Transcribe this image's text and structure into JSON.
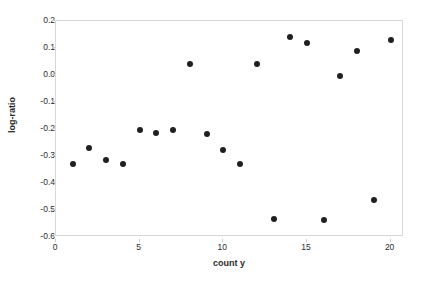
{
  "chart_data": {
    "type": "scatter",
    "title": "",
    "xlabel": "count y",
    "ylabel": "log-ratio",
    "xlim": [
      0,
      20.8
    ],
    "ylim": [
      -0.6,
      0.2
    ],
    "xticks": [
      0,
      5,
      10,
      15,
      20
    ],
    "xtick_labels": [
      "0",
      "5",
      "10",
      "15",
      "20"
    ],
    "yticks": [
      0.2,
      0.1,
      0.0,
      -0.1,
      -0.2,
      -0.3,
      -0.4,
      -0.5,
      -0.6
    ],
    "ytick_labels": [
      "0.2",
      "0.1",
      "0.0",
      "-0.1",
      "-0.2",
      "-0.3",
      "-0.4",
      "-0.5",
      "-0.6"
    ],
    "grid": false,
    "legend": null,
    "marker": {
      "shape": "circle",
      "color": "#231f20",
      "size_px": 6
    },
    "series": [
      {
        "name": "log-ratio",
        "x": [
          1,
          2,
          3,
          4,
          5,
          6,
          7,
          8,
          9,
          10,
          11,
          12,
          13,
          14,
          15,
          16,
          17,
          18,
          19,
          20
        ],
        "y": [
          -0.33,
          -0.27,
          -0.315,
          -0.33,
          -0.203,
          -0.215,
          -0.205,
          0.04,
          -0.218,
          -0.277,
          -0.33,
          0.042,
          -0.533,
          0.139,
          0.12,
          -0.537,
          -0.004,
          0.089,
          -0.462,
          0.128
        ]
      }
    ]
  },
  "figure": {
    "background_color": "#ffffff",
    "frame_color": "#d8d8dc",
    "text_color": "#2b2b2b"
  }
}
